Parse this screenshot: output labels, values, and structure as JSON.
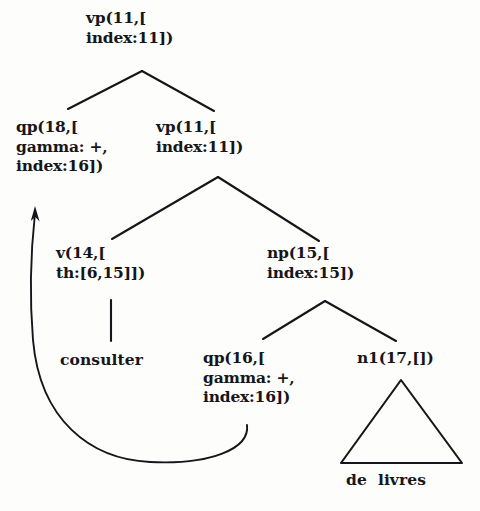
{
  "diagram": {
    "type": "tree",
    "background_color": "#fdfdfc",
    "stroke_color": "#16161a",
    "nodes": [
      {
        "id": "root-vp",
        "name": "vp-root",
        "lines": [
          "vp(11,[",
          "index:11])"
        ],
        "x": 86,
        "y": 8
      },
      {
        "id": "qp18",
        "name": "qp-18",
        "lines": [
          "qp(18,[",
          "gamma: +,",
          "index:16])"
        ],
        "x": 16,
        "y": 117
      },
      {
        "id": "vp11b",
        "name": "vp-11-inner",
        "lines": [
          "vp(11,[",
          "index:11])"
        ],
        "x": 156,
        "y": 117
      },
      {
        "id": "v14",
        "name": "v-14",
        "lines": [
          "v(14,[",
          "th:[6,15]])"
        ],
        "x": 56,
        "y": 243
      },
      {
        "id": "np15",
        "name": "np-15",
        "lines": [
          "np(15,[",
          "index:15])"
        ],
        "x": 267,
        "y": 243
      },
      {
        "id": "qp16",
        "name": "qp-16",
        "lines": [
          "qp(16,[",
          "gamma: +,",
          "index:16])"
        ],
        "x": 203,
        "y": 348
      },
      {
        "id": "n117",
        "name": "n1-17",
        "lines": [
          "n1(17,[])"
        ],
        "x": 357,
        "y": 348
      }
    ],
    "leaves": [
      {
        "id": "consulter",
        "name": "terminal-consulter",
        "text": "consulter",
        "x": 60,
        "y": 350
      },
      {
        "id": "de-livres",
        "name": "terminal-de-livres",
        "text": "de  livres",
        "x": 346,
        "y": 470
      }
    ],
    "edges": [
      {
        "name": "edge-root-to-qp18",
        "from": [
          142,
          71
        ],
        "to": [
          68,
          109
        ]
      },
      {
        "name": "edge-root-to-vp11",
        "from": [
          142,
          71
        ],
        "to": [
          214,
          111
        ]
      },
      {
        "name": "edge-vp11-to-v14",
        "from": [
          218,
          177
        ],
        "to": [
          112,
          239
        ]
      },
      {
        "name": "edge-vp11-to-np15",
        "from": [
          218,
          177
        ],
        "to": [
          319,
          241
        ]
      },
      {
        "name": "edge-v14-to-consulter",
        "from": [
          111,
          300
        ],
        "to": [
          111,
          341
        ]
      },
      {
        "name": "edge-np15-to-qp16",
        "from": [
          325,
          301
        ],
        "to": [
          263,
          339
        ]
      },
      {
        "name": "edge-np15-to-n117",
        "from": [
          325,
          301
        ],
        "to": [
          396,
          341
        ]
      }
    ],
    "triangle": {
      "name": "n1-subtree-triangle",
      "apex": [
        401,
        380
      ],
      "left": [
        341,
        463
      ],
      "right": [
        462,
        463
      ]
    },
    "coref_arrow": {
      "name": "coreference-arrow",
      "path": "M 247,425 C 250,449 210,465 150,462 C 90,459 40,420 33,340 C 29,292 31,250 35,213",
      "arrow_tip": [
        35,
        206
      ],
      "description": "curved arrow from qp(16) to qp(18)"
    }
  }
}
